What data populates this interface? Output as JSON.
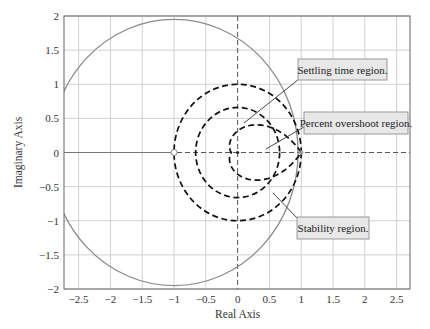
{
  "chart_data": {
    "type": "line",
    "title": "",
    "xlabel": "Real Axis",
    "ylabel": "Imaginary Axis",
    "xlim": [
      -2.73,
      2.71
    ],
    "ylim": [
      -2,
      2
    ],
    "grid": true,
    "xticks": [
      -2.5,
      -2,
      -1.5,
      -1,
      -0.5,
      0,
      0.5,
      1,
      1.5,
      2,
      2.5
    ],
    "xtick_labels": [
      "−2.5",
      "−2",
      "−1.5",
      "−1",
      "−0.5",
      "0",
      "0.5",
      "1",
      "1.5",
      "2",
      "2.5"
    ],
    "yticks": [
      2,
      1.5,
      1,
      0.5,
      0,
      -0.5,
      -1,
      -1.5,
      -2
    ],
    "ytick_labels": [
      "2",
      "1.5",
      "1",
      "0.5",
      "0",
      "−0.5",
      "−1",
      "−1.5",
      "−2"
    ],
    "series": [
      {
        "name": "Gray contour circle",
        "shape": "circle",
        "center": [
          -1,
          0
        ],
        "radius": 1.95,
        "style": "solid",
        "color": "#8a8a8a"
      },
      {
        "name": "Settling time region boundary",
        "shape": "circle",
        "center": [
          0,
          0
        ],
        "radius": 0.66,
        "style": "dashed",
        "color": "#111111"
      },
      {
        "name": "Stability region boundary (unit circle)",
        "shape": "circle",
        "center": [
          0,
          0
        ],
        "radius": 1.0,
        "style": "dashed",
        "color": "#111111"
      },
      {
        "name": "Percent overshoot region boundary",
        "shape": "log-spiral",
        "from": [
          1,
          0
        ],
        "real_axis_crossing": -0.1,
        "max_imag": 0.35,
        "style": "dashed",
        "color": "#111111"
      }
    ],
    "markers": [
      {
        "name": "open-circle",
        "x": -1,
        "y": 0
      },
      {
        "name": "dot",
        "x": 1,
        "y": 0
      }
    ],
    "annotations": [
      {
        "text": "Settling time region.",
        "box_px": [
          298,
          59,
          89,
          21
        ],
        "pointer_px": [
          [
            299,
            79
          ],
          [
            244,
            123
          ]
        ]
      },
      {
        "text": "Percent overshoot region.",
        "box_px": [
          304,
          112,
          104,
          22
        ],
        "pointer_px": [
          [
            304,
            127
          ],
          [
            266,
            149
          ]
        ]
      },
      {
        "text": "Stability region.",
        "box_px": [
          297,
          217,
          72,
          22
        ],
        "pointer_px": [
          [
            298,
            219
          ],
          [
            273,
            193
          ]
        ]
      }
    ]
  }
}
